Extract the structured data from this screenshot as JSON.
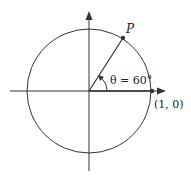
{
  "diagram": {
    "labels": {
      "point_p": "P",
      "angle": "θ = 60°",
      "point_one_zero": "(1, 0)"
    },
    "geometry": {
      "center": [
        89,
        91
      ],
      "radius": 62,
      "angle_deg": 60
    },
    "colors": {
      "stroke": "#333333",
      "point": "#333333"
    }
  }
}
